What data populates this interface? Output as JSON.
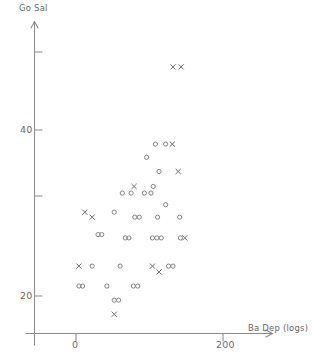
{
  "chart_data": {
    "type": "scatter",
    "title": "",
    "subtitle": "",
    "xlabel": "Ba Dep (logs)",
    "ylabel": "Go Sal",
    "xlim": [
      -35,
      250
    ],
    "ylim": [
      13,
      66
    ],
    "grid": false,
    "legend": null,
    "xticks": [
      {
        "value": 0,
        "label": "0"
      },
      {
        "value": 200,
        "label": "200"
      }
    ],
    "yticks": [
      {
        "value": 60,
        "label": ""
      },
      {
        "value": 40,
        "label": "40"
      },
      {
        "value": 30,
        "label": ""
      },
      {
        "value": 20,
        "label": "20"
      }
    ],
    "series": [
      {
        "name": "open-circle",
        "marker": "o",
        "color": "#7d7d7d",
        "points": [
          [
            108,
            38.3
          ],
          [
            122,
            38.3
          ],
          [
            96,
            36.7
          ],
          [
            113,
            35.0
          ],
          [
            105,
            33.2
          ],
          [
            63,
            32.4
          ],
          [
            75,
            32.4
          ],
          [
            93,
            32.4
          ],
          [
            102,
            32.4
          ],
          [
            122,
            31.0
          ],
          [
            52,
            30.1
          ],
          [
            80,
            29.5
          ],
          [
            86,
            29.5
          ],
          [
            111,
            29.5
          ],
          [
            141,
            29.5
          ],
          [
            30,
            27.4
          ],
          [
            35,
            27.4
          ],
          [
            67,
            27.0
          ],
          [
            72,
            27.0
          ],
          [
            104,
            27.0
          ],
          [
            110,
            27.0
          ],
          [
            116,
            27.0
          ],
          [
            142,
            27.0
          ],
          [
            22,
            23.6
          ],
          [
            60,
            23.6
          ],
          [
            126,
            23.6
          ],
          [
            132,
            23.6
          ],
          [
            4,
            21.2
          ],
          [
            9,
            21.2
          ],
          [
            42,
            21.2
          ],
          [
            78,
            21.2
          ],
          [
            84,
            21.2
          ],
          [
            52,
            19.5
          ],
          [
            58,
            19.5
          ]
        ]
      },
      {
        "name": "cross",
        "marker": "x",
        "color": "#6f6f6f",
        "points": [
          [
            132,
            47.6
          ],
          [
            143,
            47.6
          ],
          [
            131,
            38.3
          ],
          [
            139,
            35.0
          ],
          [
            79,
            33.2
          ],
          [
            12,
            30.1
          ],
          [
            22,
            29.5
          ],
          [
            148,
            27.0
          ],
          [
            4,
            23.6
          ],
          [
            104,
            23.6
          ],
          [
            113,
            22.9
          ],
          [
            52,
            17.8
          ]
        ]
      }
    ]
  }
}
